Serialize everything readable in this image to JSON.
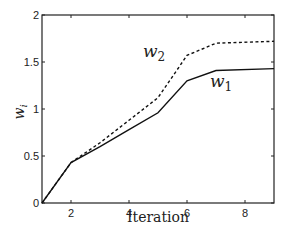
{
  "chart_data": {
    "type": "line",
    "title": "",
    "xlabel": "Iteration",
    "ylabel": "w_i",
    "xlim": [
      1,
      9
    ],
    "ylim": [
      0,
      2
    ],
    "xticks": [
      2,
      4,
      6,
      8
    ],
    "yticks": [
      0,
      0.5,
      1,
      1.5,
      2
    ],
    "xtick_labels": [
      "2",
      "4",
      "6",
      "8"
    ],
    "ytick_labels": [
      "0",
      "0.5",
      "1",
      "1.5",
      "2"
    ],
    "grid": false,
    "legend": "inline labels",
    "series": [
      {
        "name": "w1",
        "label": "w",
        "subscript": "1",
        "style": "solid",
        "x": [
          1,
          2,
          3,
          4,
          5,
          6,
          7,
          9
        ],
        "values": [
          0,
          0.43,
          0.6,
          0.78,
          0.96,
          1.3,
          1.41,
          1.43
        ]
      },
      {
        "name": "w2",
        "label": "w",
        "subscript": "2",
        "style": "dashed",
        "x": [
          1,
          2,
          3,
          4,
          5,
          6,
          7,
          9
        ],
        "values": [
          0,
          0.43,
          0.64,
          0.88,
          1.12,
          1.57,
          1.7,
          1.72
        ]
      }
    ]
  }
}
